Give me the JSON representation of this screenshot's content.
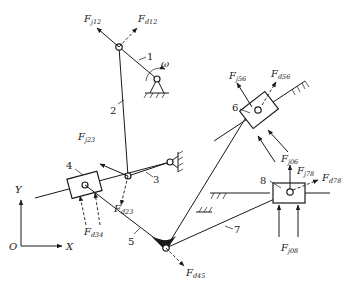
{
  "figure": {
    "links": [
      {
        "id": "1",
        "label": "1"
      },
      {
        "id": "2",
        "label": "2"
      },
      {
        "id": "3",
        "label": "3"
      },
      {
        "id": "4",
        "label": "4"
      },
      {
        "id": "5",
        "label": "5"
      },
      {
        "id": "6",
        "label": "6"
      },
      {
        "id": "7",
        "label": "7"
      },
      {
        "id": "8",
        "label": "8"
      }
    ],
    "angular_velocity": "ω",
    "axes": {
      "origin": "O",
      "x": "X",
      "y": "Y"
    },
    "forces": {
      "fj12": {
        "main": "F",
        "sub": "j12"
      },
      "fd12": {
        "main": "F",
        "sub": "d12"
      },
      "fj23": {
        "main": "F",
        "sub": "j23"
      },
      "fd23": {
        "main": "F",
        "sub": "d23"
      },
      "fd34": {
        "main": "F",
        "sub": "d34"
      },
      "fd45": {
        "main": "F",
        "sub": "d45"
      },
      "fj56": {
        "main": "F",
        "sub": "j56"
      },
      "fd56": {
        "main": "F",
        "sub": "d56"
      },
      "fj06": {
        "main": "F",
        "sub": "j06"
      },
      "fj78": {
        "main": "F",
        "sub": "j78"
      },
      "fd78": {
        "main": "F",
        "sub": "d78"
      },
      "fj08": {
        "main": "F",
        "sub": "j08"
      }
    }
  }
}
